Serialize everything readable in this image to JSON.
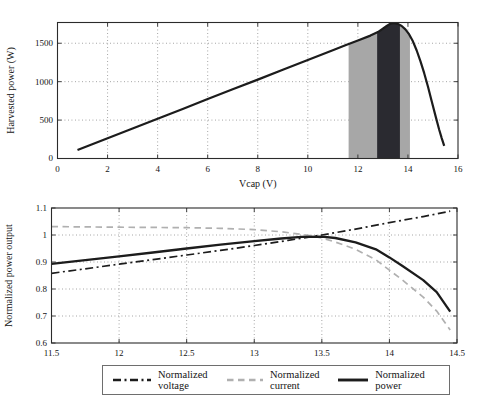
{
  "chart_data": [
    {
      "name": "harvested-power",
      "type": "line",
      "title": "",
      "xlabel": "Vcap (V)",
      "ylabel": "Harvested power (W)",
      "xlim": [
        0,
        16
      ],
      "ylim": [
        0,
        1770
      ],
      "grid": true,
      "xticks": [
        0,
        2,
        4,
        6,
        8,
        10,
        12,
        14,
        16
      ],
      "xtick_labels": [
        "0",
        "2",
        "4",
        "6",
        "8",
        "10",
        "12",
        "14",
        "16"
      ],
      "yticks": [
        0,
        500,
        1000,
        1500
      ],
      "ytick_labels": [
        "0",
        "500",
        "1000",
        "1500"
      ],
      "bands": [
        {
          "name": "operating-band-outer",
          "from": 11.63,
          "to": 14.08,
          "color": "#a7a7a7"
        },
        {
          "name": "operating-band-inner",
          "from": 12.77,
          "to": 13.68,
          "color": "#2a2a30"
        }
      ],
      "series": [
        {
          "name": "Harvested power",
          "style": "solid",
          "color": "#1c1c1c",
          "width": 2.2,
          "z": 0,
          "points": [
            [
              0.8,
              110
            ],
            [
              2,
              263
            ],
            [
              3,
              390
            ],
            [
              4,
              518
            ],
            [
              5,
              645
            ],
            [
              6,
              773
            ],
            [
              7,
              900
            ],
            [
              8,
              1027
            ],
            [
              9,
              1155
            ],
            [
              10,
              1282
            ],
            [
              11,
              1410
            ],
            [
              11.5,
              1473
            ],
            [
              12,
              1537
            ],
            [
              12.5,
              1600
            ],
            [
              12.8,
              1645
            ],
            [
              13,
              1690
            ],
            [
              13.15,
              1725
            ],
            [
              13.3,
              1755
            ],
            [
              13.45,
              1762
            ],
            [
              13.6,
              1752
            ],
            [
              13.75,
              1725
            ],
            [
              13.9,
              1680
            ],
            [
              14.05,
              1615
            ],
            [
              14.2,
              1525
            ],
            [
              14.35,
              1405
            ],
            [
              14.5,
              1265
            ],
            [
              14.65,
              1110
            ],
            [
              14.8,
              935
            ],
            [
              14.95,
              745
            ],
            [
              15.1,
              555
            ],
            [
              15.25,
              375
            ],
            [
              15.35,
              265
            ],
            [
              15.45,
              165
            ]
          ]
        }
      ]
    },
    {
      "name": "normalized-output",
      "type": "line",
      "title": "",
      "xlabel": "",
      "ylabel": "Normalized power output",
      "xlim": [
        11.5,
        14.5
      ],
      "ylim": [
        0.6,
        1.1
      ],
      "grid": true,
      "legend_position": "bottom",
      "xticks": [
        11.5,
        12,
        12.5,
        13,
        13.5,
        14,
        14.5
      ],
      "xtick_labels": [
        "11.5",
        "12",
        "12.5",
        "13",
        "13.5",
        "14",
        "14.5"
      ],
      "yticks": [
        0.6,
        0.7,
        0.8,
        0.9,
        1.0,
        1.1
      ],
      "ytick_labels": [
        "0.6",
        "0.7",
        "0.8",
        "0.9",
        "1",
        "1.1"
      ],
      "series": [
        {
          "name": "Normalized voltage",
          "style": "dashdot",
          "color": "#1c1c1c",
          "width": 1.7,
          "z": 1,
          "points": [
            [
              11.5,
              0.858
            ],
            [
              11.75,
              0.875
            ],
            [
              12,
              0.892
            ],
            [
              12.25,
              0.909
            ],
            [
              12.5,
              0.926
            ],
            [
              12.75,
              0.943
            ],
            [
              13,
              0.961
            ],
            [
              13.25,
              0.98
            ],
            [
              13.5,
              1.0
            ],
            [
              13.75,
              1.022
            ],
            [
              14,
              1.046
            ],
            [
              14.25,
              1.068
            ],
            [
              14.45,
              1.088
            ]
          ]
        },
        {
          "name": "Normalized current",
          "style": "dashed",
          "color": "#b0b0b0",
          "width": 1.7,
          "z": 0,
          "points": [
            [
              11.5,
              1.031
            ],
            [
              11.75,
              1.03
            ],
            [
              12,
              1.029
            ],
            [
              12.25,
              1.028
            ],
            [
              12.5,
              1.027
            ],
            [
              12.75,
              1.025
            ],
            [
              13,
              1.02
            ],
            [
              13.2,
              1.012
            ],
            [
              13.4,
              0.999
            ],
            [
              13.5,
              0.989
            ],
            [
              13.6,
              0.974
            ],
            [
              13.75,
              0.947
            ],
            [
              13.9,
              0.908
            ],
            [
              14,
              0.87
            ],
            [
              14.1,
              0.832
            ],
            [
              14.25,
              0.77
            ],
            [
              14.35,
              0.718
            ],
            [
              14.45,
              0.648
            ]
          ]
        },
        {
          "name": "Normalized power",
          "style": "solid",
          "color": "#1c1c1c",
          "width": 2.3,
          "z": 2,
          "points": [
            [
              11.5,
              0.893
            ],
            [
              11.75,
              0.907
            ],
            [
              12,
              0.921
            ],
            [
              12.25,
              0.935
            ],
            [
              12.5,
              0.95
            ],
            [
              12.75,
              0.964
            ],
            [
              13,
              0.977
            ],
            [
              13.2,
              0.987
            ],
            [
              13.35,
              0.993
            ],
            [
              13.5,
              0.994
            ],
            [
              13.6,
              0.989
            ],
            [
              13.75,
              0.973
            ],
            [
              13.9,
              0.947
            ],
            [
              14,
              0.917
            ],
            [
              14.1,
              0.884
            ],
            [
              14.25,
              0.833
            ],
            [
              14.35,
              0.788
            ],
            [
              14.45,
              0.716
            ]
          ]
        }
      ]
    }
  ],
  "colors": {
    "line_black": "#1c1c1c",
    "line_gray": "#b0b0b0",
    "band_gray": "#a7a7a7",
    "band_dark": "#2a2a30",
    "gridline": "#8f8f8f"
  }
}
